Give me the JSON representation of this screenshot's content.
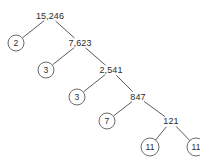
{
  "diagram": {
    "type": "factor-tree",
    "background_color": "#ffffff",
    "line_color": "#5a5a5a",
    "circle_color": "#6b6b6b",
    "text_color": "#2b2b2b",
    "root_value": "15,246",
    "nodes": [
      {
        "id": "n0",
        "label": "15,246",
        "circled": false,
        "x": 50,
        "y": 16
      },
      {
        "id": "n1",
        "label": "2",
        "circled": true,
        "x": 16,
        "y": 43
      },
      {
        "id": "n2",
        "label": "7,623",
        "circled": false,
        "x": 80,
        "y": 43
      },
      {
        "id": "n3",
        "label": "3",
        "circled": true,
        "x": 46,
        "y": 70
      },
      {
        "id": "n4",
        "label": "2,541",
        "circled": false,
        "x": 111,
        "y": 70
      },
      {
        "id": "n5",
        "label": "3",
        "circled": true,
        "x": 77,
        "y": 97
      },
      {
        "id": "n6",
        "label": "847",
        "circled": false,
        "x": 138,
        "y": 97
      },
      {
        "id": "n7",
        "label": "7",
        "circled": true,
        "x": 107,
        "y": 121
      },
      {
        "id": "n8",
        "label": "121",
        "circled": false,
        "x": 171,
        "y": 121
      },
      {
        "id": "n9",
        "label": "11",
        "circled": true,
        "x": 150,
        "y": 147
      },
      {
        "id": "n10",
        "label": "11",
        "circled": true,
        "x": 196,
        "y": 147
      }
    ],
    "edges": [
      {
        "from": "n0",
        "to": "n1"
      },
      {
        "from": "n0",
        "to": "n2"
      },
      {
        "from": "n2",
        "to": "n3"
      },
      {
        "from": "n2",
        "to": "n4"
      },
      {
        "from": "n4",
        "to": "n5"
      },
      {
        "from": "n4",
        "to": "n6"
      },
      {
        "from": "n6",
        "to": "n7"
      },
      {
        "from": "n6",
        "to": "n8"
      },
      {
        "from": "n8",
        "to": "n9"
      },
      {
        "from": "n8",
        "to": "n10"
      }
    ],
    "prime_factors": [
      "2",
      "3",
      "3",
      "7",
      "11",
      "11"
    ]
  }
}
